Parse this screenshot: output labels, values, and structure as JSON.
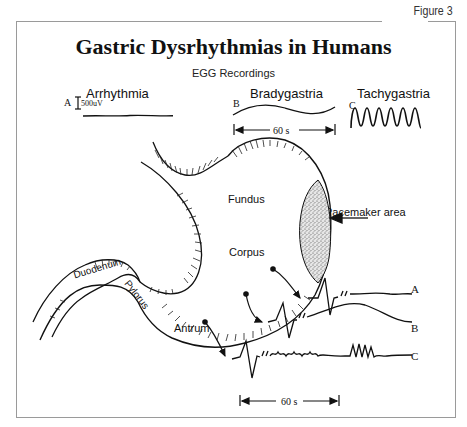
{
  "figure_label": "Figure 3",
  "title": "Gastric Dysrhythmias in Humans",
  "subtitle": "EGG Recordings",
  "egg_examples": [
    {
      "letter": "A",
      "label": "Arrhythmia",
      "scale": "500uV"
    },
    {
      "letter": "B",
      "label": "Bradygastria"
    },
    {
      "letter": "C",
      "label": "Tachygastria"
    }
  ],
  "time_scale_top": "60 s",
  "time_scale_bottom": "60 s",
  "stomach_regions": {
    "fundus": "Fundus",
    "corpus": "Corpus",
    "antrum": "Antrum",
    "pylorus": "Pylorus",
    "duodenum": "Duodenum",
    "pacemaker": "Pacemaker area"
  },
  "traces": [
    {
      "letter": "A"
    },
    {
      "letter": "B"
    },
    {
      "letter": "C"
    }
  ]
}
